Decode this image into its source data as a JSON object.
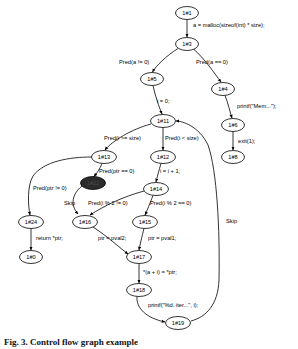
{
  "figure": {
    "type": "control-flow-graph",
    "caption": "Fig. 3.  Control flow graph example",
    "highlight_color": "#2b2b2b",
    "node_fill": "#ffffff",
    "stroke_color": "#000000"
  },
  "nodes": [
    {
      "id": "n1",
      "label": "1#1",
      "cx": 187,
      "cy": 13,
      "rx": 11.5,
      "ry": 6.5,
      "highlighted": false
    },
    {
      "id": "n3",
      "label": "1#3",
      "cx": 187,
      "cy": 44,
      "rx": 11.5,
      "ry": 6.5,
      "highlighted": false
    },
    {
      "id": "n5",
      "label": "1#5",
      "cx": 152,
      "cy": 79,
      "rx": 11.5,
      "ry": 6.5,
      "highlighted": false
    },
    {
      "id": "n4",
      "label": "1#4",
      "cx": 223,
      "cy": 89,
      "rx": 11.5,
      "ry": 6.5,
      "highlighted": false
    },
    {
      "id": "n6",
      "label": "1#6",
      "cx": 233,
      "cy": 125,
      "rx": 11.5,
      "ry": 6.5,
      "highlighted": false
    },
    {
      "id": "n8",
      "label": "1#8",
      "cx": 233,
      "cy": 157,
      "rx": 11.5,
      "ry": 6.5,
      "highlighted": false
    },
    {
      "id": "n11",
      "label": "1#11",
      "cx": 163,
      "cy": 121,
      "rx": 12.5,
      "ry": 6.5,
      "highlighted": false
    },
    {
      "id": "n13",
      "label": "1#13",
      "cx": 104,
      "cy": 157,
      "rx": 12.5,
      "ry": 6.5,
      "highlighted": false
    },
    {
      "id": "n12",
      "label": "1#12",
      "cx": 163,
      "cy": 157,
      "rx": 12.5,
      "ry": 6.5,
      "highlighted": false
    },
    {
      "id": "n22",
      "label": "1#22",
      "cx": 93,
      "cy": 183,
      "rx": 12.5,
      "ry": 6.5,
      "highlighted": true
    },
    {
      "id": "n14",
      "label": "1#14",
      "cx": 156,
      "cy": 189,
      "rx": 12.5,
      "ry": 6.5,
      "highlighted": false
    },
    {
      "id": "n24",
      "label": "1#24",
      "cx": 31,
      "cy": 222,
      "rx": 12.5,
      "ry": 6.5,
      "highlighted": false
    },
    {
      "id": "n16",
      "label": "1#16",
      "cx": 85,
      "cy": 222,
      "rx": 12.5,
      "ry": 6.5,
      "highlighted": false
    },
    {
      "id": "n15",
      "label": "1#15",
      "cx": 145,
      "cy": 222,
      "rx": 12.5,
      "ry": 6.5,
      "highlighted": false
    },
    {
      "id": "n0",
      "label": "1#0",
      "cx": 31,
      "cy": 257,
      "rx": 11.5,
      "ry": 6.5,
      "highlighted": false
    },
    {
      "id": "n17",
      "label": "1#17",
      "cx": 139,
      "cy": 257,
      "rx": 12.5,
      "ry": 6.5,
      "highlighted": false
    },
    {
      "id": "n18",
      "label": "1#18",
      "cx": 139,
      "cy": 290,
      "rx": 12.5,
      "ry": 6.5,
      "highlighted": false
    },
    {
      "id": "n19",
      "label": "1#19",
      "cx": 178,
      "cy": 323,
      "rx": 12.5,
      "ry": 6.5,
      "highlighted": false
    }
  ],
  "edges": [
    {
      "from": "n1",
      "to": "n3",
      "label": "a = malloc(sizeof(int) * size);",
      "label_x": 193,
      "label_y": 27
    },
    {
      "from": "n3",
      "to": "n5",
      "label": "Pred(a != 0)",
      "label_x": 119,
      "label_y": 64
    },
    {
      "from": "n3",
      "to": "n4",
      "label": "Pred(a == 0)",
      "label_x": 196,
      "label_y": 64
    },
    {
      "from": "n4",
      "to": "n6",
      "label": "printf(\"Mem...\");",
      "label_x": 237,
      "label_y": 108
    },
    {
      "from": "n6",
      "to": "n8",
      "label": "exit(1);",
      "label_x": 238,
      "label_y": 143
    },
    {
      "from": "n5",
      "to": "n11",
      "label": "i = 0;",
      "label_x": 157,
      "label_y": 103
    },
    {
      "from": "n11",
      "to": "n13",
      "label": "Pred(i >= size)",
      "label_x": 104,
      "label_y": 140
    },
    {
      "from": "n11",
      "to": "n12",
      "label": "Pred(i < size)",
      "label_x": 165,
      "label_y": 140
    },
    {
      "from": "n13",
      "to": "n22",
      "label": "Pred(ptr == 0)",
      "label_x": 99,
      "label_y": 173
    },
    {
      "from": "n12",
      "to": "n14",
      "label": "i = i + 1;",
      "label_x": 160,
      "label_y": 173
    },
    {
      "from": "n13",
      "to": "n24",
      "label": "Pred(ptr != 0)",
      "label_x": 33,
      "label_y": 190
    },
    {
      "from": "n22",
      "to": "n16",
      "label": "Skip",
      "label_x": 64,
      "label_y": 205
    },
    {
      "from": "n14",
      "to": "n16",
      "label": "Pred(i % 2 != 0)",
      "label_x": 88,
      "label_y": 205
    },
    {
      "from": "n14",
      "to": "n15",
      "label": "Pred(i % 2 == 0)",
      "label_x": 150,
      "label_y": 205
    },
    {
      "from": "n24",
      "to": "n0",
      "label": "return *ptr;",
      "label_x": 36,
      "label_y": 240
    },
    {
      "from": "n16",
      "to": "n17",
      "label": "ptr = pval2;",
      "label_x": 98,
      "label_y": 240
    },
    {
      "from": "n15",
      "to": "n17",
      "label": "ptr = pval1;",
      "label_x": 148,
      "label_y": 240
    },
    {
      "from": "n17",
      "to": "n18",
      "label": "*(a + i) = *ptr;",
      "label_x": 143,
      "label_y": 274
    },
    {
      "from": "n18",
      "to": "n19",
      "label": "printf(\"%d. iter...\", i);",
      "label_x": 148,
      "label_y": 307
    },
    {
      "from": "n19",
      "to": "n11",
      "label": "Skip",
      "label_x": 226,
      "label_y": 223
    }
  ]
}
